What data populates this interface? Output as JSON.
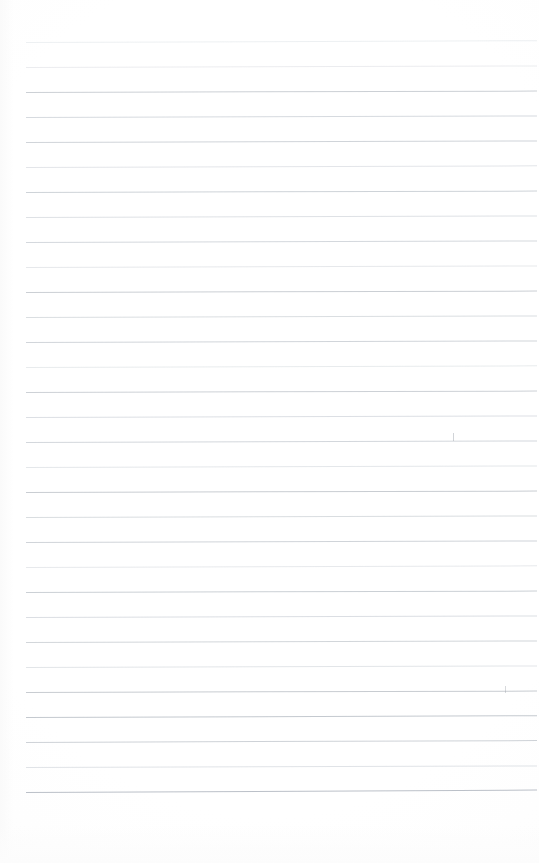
{
  "page": {
    "kind": "scanned-ruled-notepad-page",
    "width_px": 539,
    "height_px": 863,
    "background_color": "#fefefe",
    "content_text": "",
    "is_blank": "true"
  },
  "rules": {
    "label": "horizontal ruled lines",
    "count": 31,
    "first_line_y_px": 42,
    "line_spacing_px": 25,
    "left_margin_px": 26,
    "right_edge_px": 537,
    "line_thickness_px": 1,
    "base_color": "#c9ced4",
    "tilt_degrees": -0.18,
    "lines": [
      {
        "y": 42,
        "color": "#dfe3e7",
        "opacity": 0.55,
        "tilt": -0.2
      },
      {
        "y": 67,
        "color": "#dcdfe4",
        "opacity": 0.58,
        "tilt": -0.18
      },
      {
        "y": 92,
        "color": "#c3c8ce",
        "opacity": 0.85,
        "tilt": -0.16
      },
      {
        "y": 117,
        "color": "#cbd0d6",
        "opacity": 0.78,
        "tilt": -0.18
      },
      {
        "y": 142,
        "color": "#c6cbd1",
        "opacity": 0.82,
        "tilt": -0.17
      },
      {
        "y": 167,
        "color": "#d4d8dd",
        "opacity": 0.66,
        "tilt": -0.19
      },
      {
        "y": 192,
        "color": "#c5cad0",
        "opacity": 0.84,
        "tilt": -0.16
      },
      {
        "y": 217,
        "color": "#d0d4da",
        "opacity": 0.7,
        "tilt": -0.18
      },
      {
        "y": 242,
        "color": "#c9ced4",
        "opacity": 0.8,
        "tilt": -0.17
      },
      {
        "y": 267,
        "color": "#d6dade",
        "opacity": 0.62,
        "tilt": -0.18
      },
      {
        "y": 292,
        "color": "#c2c7cd",
        "opacity": 0.86,
        "tilt": -0.16
      },
      {
        "y": 317,
        "color": "#cdd2d7",
        "opacity": 0.74,
        "tilt": -0.18
      },
      {
        "y": 342,
        "color": "#c7ccd2",
        "opacity": 0.82,
        "tilt": -0.17
      },
      {
        "y": 367,
        "color": "#d8dce0",
        "opacity": 0.58,
        "tilt": -0.19
      },
      {
        "y": 392,
        "color": "#c4c9cf",
        "opacity": 0.85,
        "tilt": -0.16
      },
      {
        "y": 417,
        "color": "#cfd3d9",
        "opacity": 0.72,
        "tilt": -0.18
      },
      {
        "y": 442,
        "color": "#c8cdd3",
        "opacity": 0.8,
        "tilt": -0.17
      },
      {
        "y": 467,
        "color": "#d5d9de",
        "opacity": 0.64,
        "tilt": -0.18
      },
      {
        "y": 492,
        "color": "#c1c6cc",
        "opacity": 0.88,
        "tilt": -0.16
      },
      {
        "y": 517,
        "color": "#ccd1d6",
        "opacity": 0.75,
        "tilt": -0.18
      },
      {
        "y": 542,
        "color": "#c6cbd1",
        "opacity": 0.82,
        "tilt": -0.17
      },
      {
        "y": 567,
        "color": "#d7dbe0",
        "opacity": 0.6,
        "tilt": -0.19
      },
      {
        "y": 592,
        "color": "#c3c8ce",
        "opacity": 0.86,
        "tilt": -0.16
      },
      {
        "y": 617,
        "color": "#ced2d8",
        "opacity": 0.73,
        "tilt": -0.18
      },
      {
        "y": 642,
        "color": "#c7ccd2",
        "opacity": 0.81,
        "tilt": -0.17
      },
      {
        "y": 667,
        "color": "#d3d7dc",
        "opacity": 0.66,
        "tilt": -0.18
      },
      {
        "y": 692,
        "color": "#c0c5cb",
        "opacity": 0.88,
        "tilt": -0.16
      },
      {
        "y": 717,
        "color": "#bec3ca",
        "opacity": 0.9,
        "tilt": -0.2
      },
      {
        "y": 742,
        "color": "#c5cad0",
        "opacity": 0.85,
        "tilt": -0.22
      },
      {
        "y": 767,
        "color": "#d2d6db",
        "opacity": 0.68,
        "tilt": -0.18
      },
      {
        "y": 792,
        "color": "#b7bdc5",
        "opacity": 0.95,
        "tilt": -0.28
      }
    ]
  },
  "ink_marks": [
    {
      "name": "pen-tick-upper",
      "x": 453,
      "y": 433,
      "width": 1,
      "height": 8,
      "opacity": 0.45
    },
    {
      "name": "pen-tick-lower",
      "x": 505,
      "y": 686,
      "width": 1,
      "height": 7,
      "opacity": 0.4
    }
  ]
}
